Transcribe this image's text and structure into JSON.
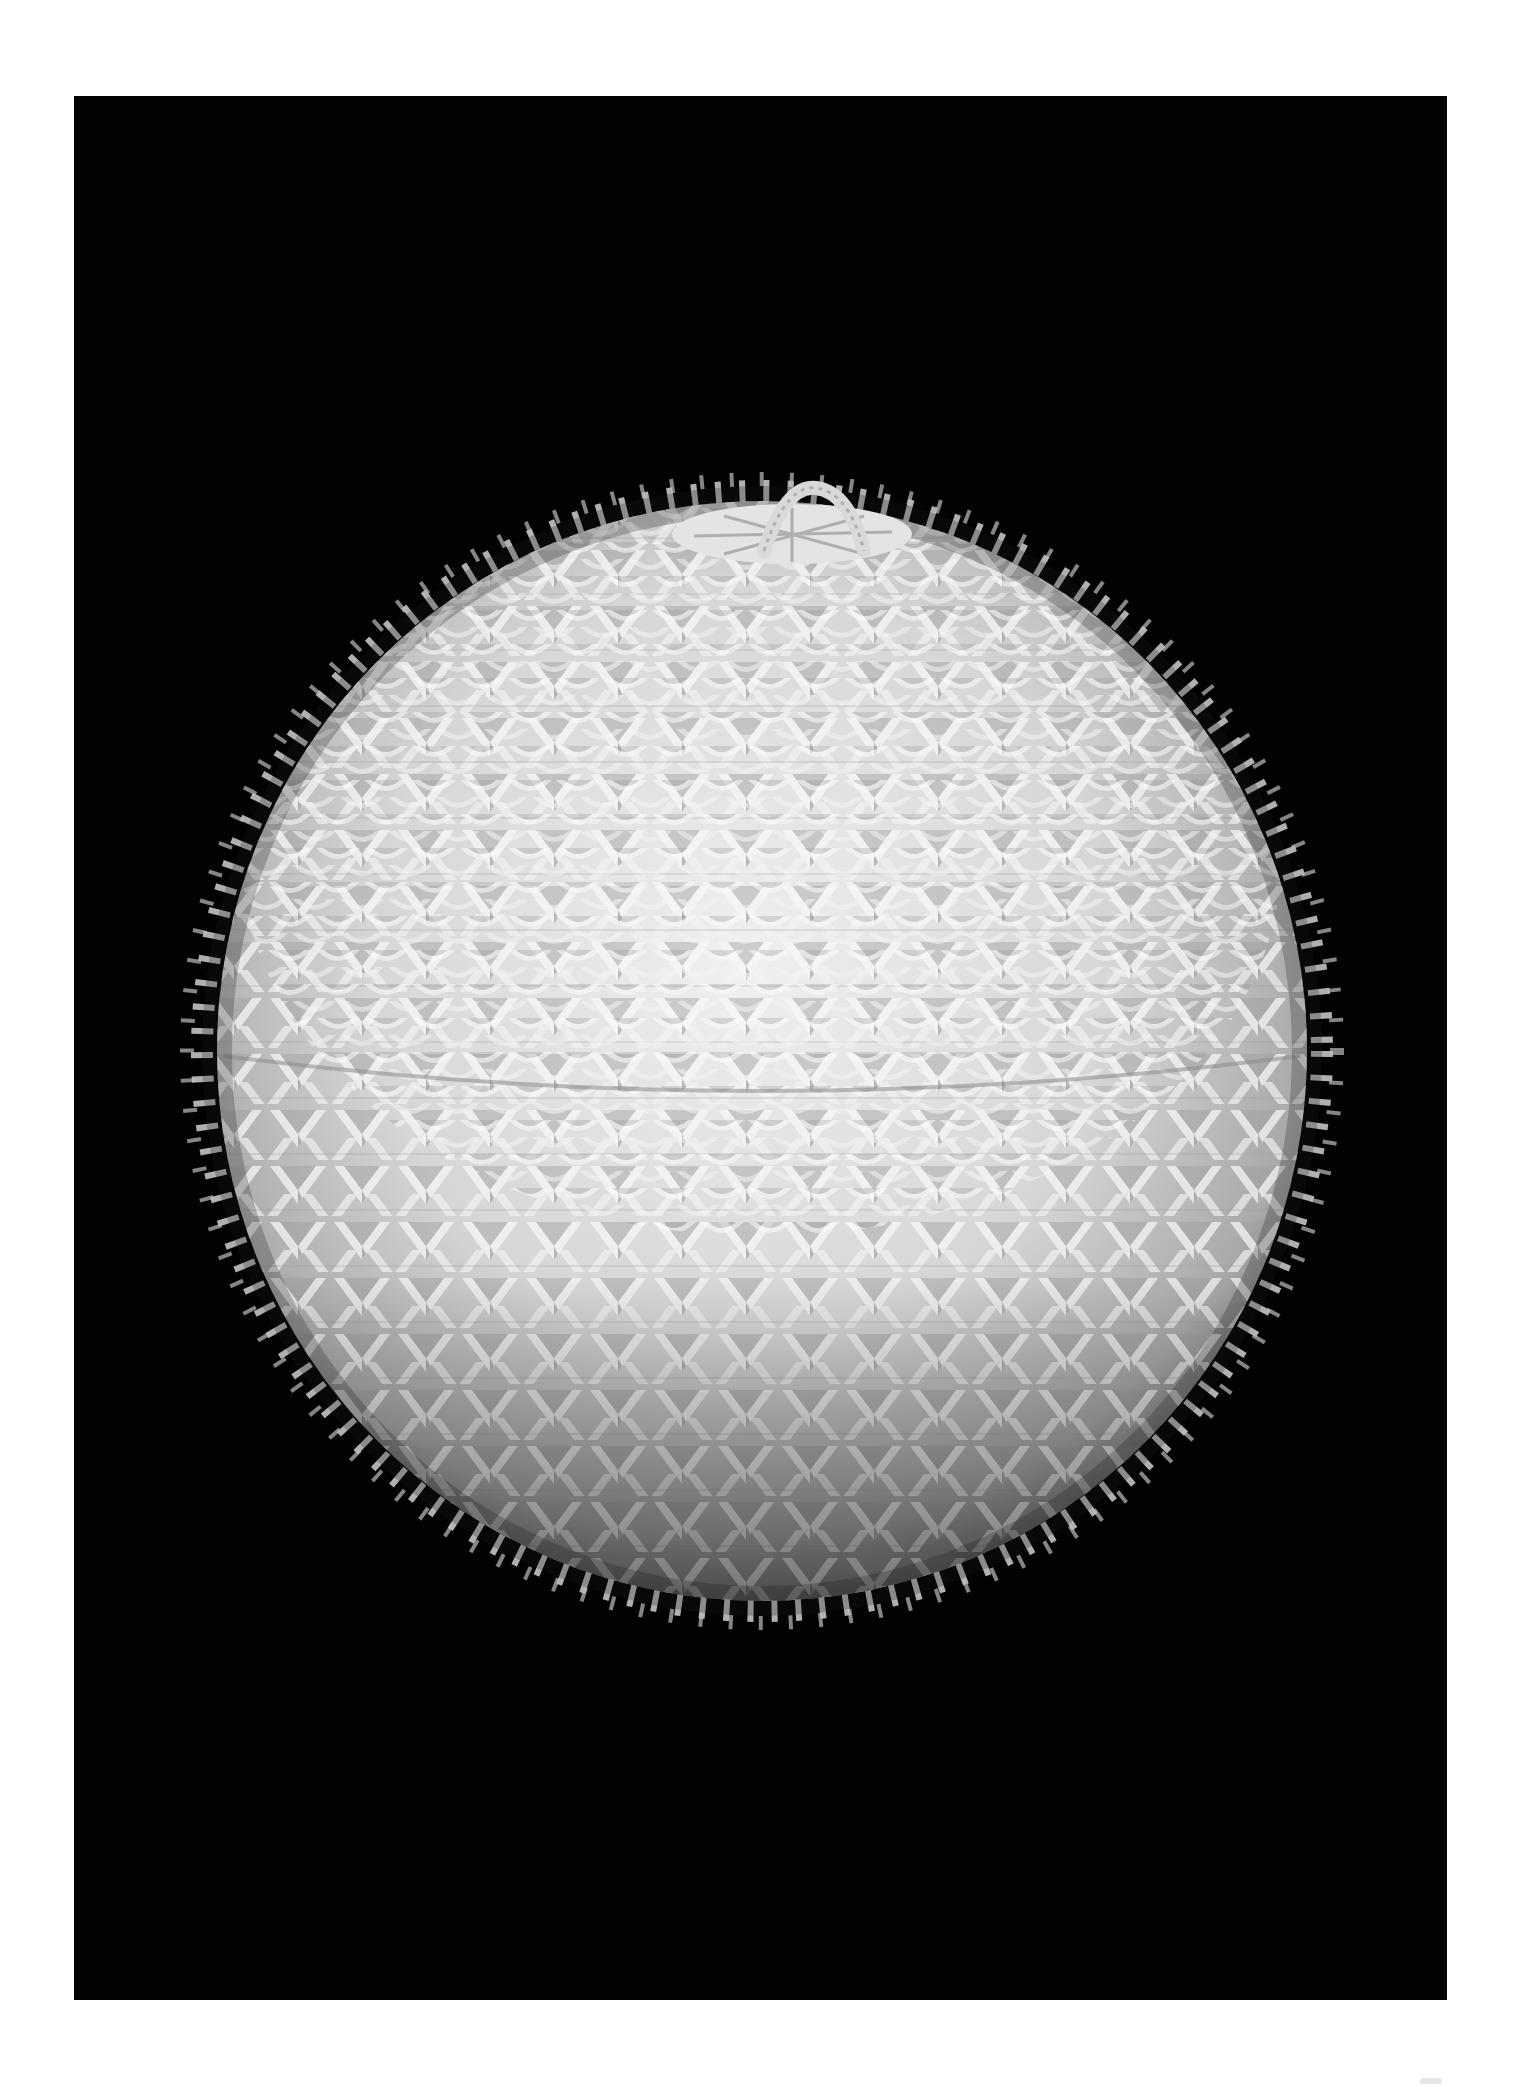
{
  "photo": {
    "subject": "Woven lidded porcupine-stitch basket with twisted handle",
    "background_color": "#020202",
    "page_color": "#ffffff",
    "object_tone_highlight": "#f2f2f2",
    "object_tone_mid": "#c9c9c9",
    "object_tone_shadow": "#6e6e6e"
  }
}
